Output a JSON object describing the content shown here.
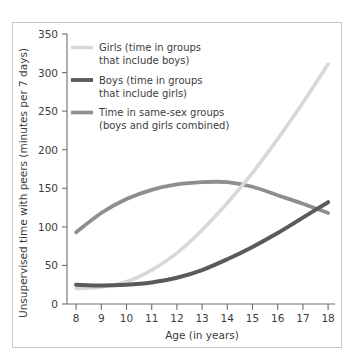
{
  "chart_data": {
    "type": "line",
    "title": "",
    "xlabel": "Age (in years)",
    "ylabel": "Unsupervised time with peers (minutes per 7 days)",
    "xlim": [
      8,
      18
    ],
    "ylim": [
      0,
      350
    ],
    "xticks": [
      "8",
      "9",
      "10",
      "11",
      "12",
      "13",
      "14",
      "15",
      "16",
      "17",
      "18"
    ],
    "yticks": [
      "0",
      "50",
      "100",
      "150",
      "200",
      "250",
      "300",
      "350"
    ],
    "grid": false,
    "legend_position": "upper-left-inside",
    "x": [
      8,
      9,
      10,
      11,
      12,
      13,
      14,
      15,
      16,
      17,
      18
    ],
    "series": [
      {
        "name": "Girls (time in groups that include boys)",
        "label_line1": "Girls (time in groups",
        "label_line2": "that include boys)",
        "color": "#d8d8d8",
        "values": [
          20,
          22,
          29,
          44,
          66,
          96,
          131,
          170,
          214,
          261,
          311
        ]
      },
      {
        "name": "Boys (time in groups that include girls)",
        "label_line1": "Boys (time in groups",
        "label_line2": "that include girls)",
        "color": "#5a5a5a",
        "values": [
          25,
          24,
          25,
          28,
          34,
          44,
          58,
          74,
          92,
          112,
          132
        ]
      },
      {
        "name": "Time in same-sex groups (boys and girls combined)",
        "label_line1": "Time in same-sex groups",
        "label_line2": "(boys and girls combined)",
        "color": "#8e8e8e",
        "values": [
          93,
          118,
          136,
          148,
          155,
          158,
          158,
          152,
          141,
          130,
          118
        ]
      }
    ],
    "annotations": [
      "Girls curve crosses same-sex curve near age 15.3 at about 155 minutes",
      "Same-sex curve peaks near ages 13-14 at about 158 minutes",
      "Boys curve crosses same-sex curve near age 18 at about 125 minutes"
    ]
  },
  "colors": {
    "frame": "#c9c9c9",
    "axis": "#6e6e6e",
    "text": "#3c3c3c",
    "girls": "#d8d8d8",
    "boys": "#5a5a5a",
    "samesex": "#8e8e8e"
  }
}
